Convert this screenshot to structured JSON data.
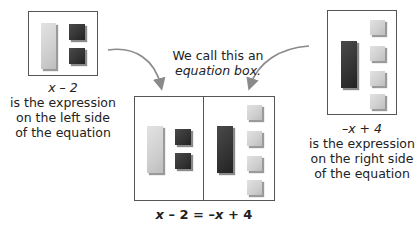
{
  "left_expression": {
    "expression": "x – 2",
    "lines": [
      "is the expression",
      "on the left side",
      "of the equation"
    ],
    "tiles": {
      "x_tiles": 1,
      "negative_unit_tiles": 2
    }
  },
  "right_expression": {
    "expression": "–x + 4",
    "lines": [
      "is the expression",
      "on the right side",
      "of the equation"
    ],
    "tiles": {
      "negative_x_tiles": 1,
      "unit_tiles": 4
    }
  },
  "center_label": {
    "line1": "We call this an",
    "line2": "equation box."
  },
  "equation": {
    "left": "x",
    "op1": " – 2 = –",
    "mid": "x",
    "op2": " + 4"
  },
  "colors": {
    "positive_tile": "#cfcfcf",
    "negative_tile": "#333333",
    "border": "#555555",
    "arrow": "#8a8a8a"
  }
}
